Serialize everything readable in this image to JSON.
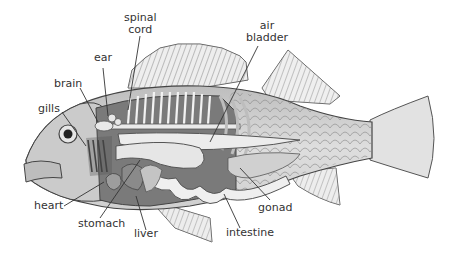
{
  "diagram": {
    "labels": {
      "spinal_cord_line1": "spinal",
      "spinal_cord_line2": "cord",
      "air_bladder_line1": "air",
      "air_bladder_line2": "bladder",
      "ear": "ear",
      "brain": "brain",
      "gills": "gills",
      "heart": "heart",
      "stomach": "stomach",
      "liver": "liver",
      "intestine": "intestine",
      "gonad": "gonad"
    },
    "colors": {
      "background": "#ffffff",
      "outline": "#444444",
      "body": "#d9d9d9",
      "dark_cavity": "#6f6f6f",
      "organs": "#e8e8e8",
      "label_text": "#333333"
    }
  }
}
